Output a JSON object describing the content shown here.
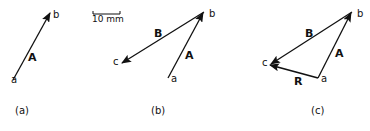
{
  "figure": {
    "scale_bar_label": "10 mm",
    "panels": [
      {
        "caption": "(a)",
        "points": {
          "a": "a",
          "b": "b"
        },
        "vectors": [
          {
            "label": "A",
            "from": "a",
            "to": "b"
          }
        ]
      },
      {
        "caption": "(b)",
        "points": {
          "a": "a",
          "b": "b",
          "c": "c"
        },
        "vectors": [
          {
            "label": "A",
            "from": "a",
            "to": "b"
          },
          {
            "label": "B",
            "from": "b",
            "to": "c"
          }
        ]
      },
      {
        "caption": "(c)",
        "points": {
          "a": "a",
          "b": "b",
          "c": "c"
        },
        "vectors": [
          {
            "label": "A",
            "from": "a",
            "to": "b"
          },
          {
            "label": "B",
            "from": "b",
            "to": "c"
          },
          {
            "label": "R",
            "from": "a",
            "to": "c"
          }
        ]
      }
    ]
  }
}
